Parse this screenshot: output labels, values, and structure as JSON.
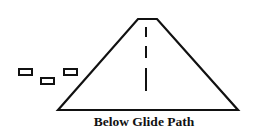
{
  "diagram": {
    "caption": "Below Glide Path",
    "elements": {
      "runway": "trapezoid runway viewed in perspective with dashed centerline",
      "approach_lights": "three small rectangles left of runway, below runway top",
      "stroke_color": "#111111",
      "background": "#ffffff"
    }
  }
}
